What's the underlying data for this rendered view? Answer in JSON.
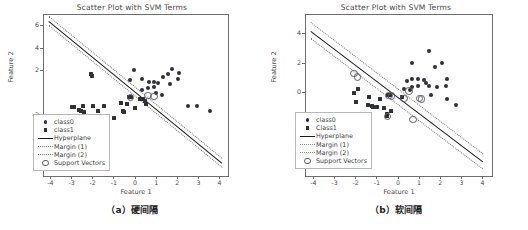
{
  "figure": {
    "captions": [
      "（a）硬间隔",
      "（b）软间隔"
    ]
  },
  "chart_data": [
    {
      "type": "scatter",
      "title": "Scatter Plot with SVM Terms",
      "xlabel": "Feature 1",
      "ylabel": "Feature 2",
      "xlim": [
        -4.35,
        4.35
      ],
      "ylim": [
        -7.4,
        7.0
      ],
      "xticks": [
        "-4",
        "-3",
        "-2",
        "-1",
        "0",
        "1",
        "2",
        "3",
        "4"
      ],
      "xtick_values": [
        -4,
        -3,
        -2,
        -1,
        0,
        1,
        2,
        3,
        4
      ],
      "yticks": [
        "-6",
        "-4",
        "-2",
        "2",
        "4",
        "6"
      ],
      "ytick_values": [
        -6,
        -4,
        -2,
        2,
        4,
        6
      ],
      "grid": false,
      "legend_position": "lower left",
      "legend": [
        {
          "label": "class0",
          "marker": "circle"
        },
        {
          "label": "class1",
          "marker": "square"
        },
        {
          "label": "Hyperplane",
          "marker": "solid-line"
        },
        {
          "label": "Margin (1)",
          "marker": "dotted-line"
        },
        {
          "label": "Margin (2)",
          "marker": "dotted-line"
        },
        {
          "label": "Support Vectors",
          "marker": "open-circle"
        }
      ],
      "series": [
        {
          "name": "class0",
          "marker": "circle",
          "points": [
            [
              -0.1,
              2.1
            ],
            [
              -0.28,
              1.15
            ],
            [
              0.28,
              1.3
            ],
            [
              0.62,
              1.05
            ],
            [
              0.86,
              1.05
            ],
            [
              1.02,
              0.95
            ],
            [
              1.3,
              1.45
            ],
            [
              1.52,
              1.7
            ],
            [
              1.7,
              2.15
            ],
            [
              2.02,
              1.85
            ],
            [
              1.98,
              1.28
            ],
            [
              1.6,
              0.8
            ],
            [
              0.86,
              0.55
            ],
            [
              0.55,
              0.45
            ],
            [
              0.3,
              0.3
            ],
            [
              2.48,
              -1.15
            ],
            [
              2.88,
              -1.15
            ],
            [
              3.48,
              -1.55
            ],
            [
              1.22,
              -0.15
            ],
            [
              0.95,
              0.05
            ]
          ]
        },
        {
          "name": "class1",
          "marker": "square",
          "points": [
            [
              -2.12,
              1.75
            ],
            [
              -2.1,
              1.55
            ],
            [
              -3.02,
              -1.2
            ],
            [
              -2.92,
              -1.22
            ],
            [
              -2.52,
              -1.18
            ],
            [
              -2.7,
              -1.5
            ],
            [
              -2.58,
              -1.62
            ],
            [
              -2.48,
              -1.72
            ],
            [
              -2.05,
              -1.12
            ],
            [
              -1.82,
              -1.62
            ],
            [
              -1.52,
              -1.12
            ],
            [
              -1.02,
              -2.2
            ],
            [
              -0.72,
              -0.85
            ],
            [
              -0.62,
              -1.55
            ],
            [
              -0.58,
              -1.7
            ],
            [
              -0.42,
              -0.92
            ],
            [
              -0.32,
              -0.3
            ],
            [
              -0.22,
              -0.32
            ],
            [
              -0.05,
              -1.35
            ],
            [
              0.18,
              -0.55
            ],
            [
              0.32,
              -0.48
            ],
            [
              0.42,
              -0.72
            ],
            [
              0.48,
              -0.98
            ]
          ]
        }
      ],
      "support_vectors": [
        [
          -0.3,
          -0.3
        ],
        [
          0.52,
          -0.12
        ],
        [
          0.8,
          -0.22
        ]
      ],
      "hyperplane": {
        "label": "Hyperplane",
        "p1": [
          -4.1,
          6.5
        ],
        "p2": [
          4.1,
          -6.2
        ]
      },
      "margins": [
        {
          "label": "Margin (1)",
          "p1": [
            -4.1,
            6.9
          ],
          "p2": [
            4.1,
            -5.8
          ]
        },
        {
          "label": "Margin (2)",
          "p1": [
            -4.1,
            6.1
          ],
          "p2": [
            4.1,
            -6.6
          ]
        }
      ]
    },
    {
      "type": "scatter",
      "title": "Scatter Plot with SVM Terms",
      "xlabel": "Feature 1",
      "ylabel": "Feature 2",
      "xlim": [
        -4.4,
        4.4
      ],
      "ylim": [
        -5.6,
        5.3
      ],
      "xticks": [
        "-4",
        "-3",
        "-2",
        "-1",
        "0",
        "1",
        "2",
        "3",
        "4"
      ],
      "xtick_values": [
        -4,
        -3,
        -2,
        -1,
        0,
        1,
        2,
        3,
        4
      ],
      "yticks": [
        "-4",
        "-2",
        "0",
        "2",
        "4"
      ],
      "ytick_values": [
        -4,
        -2,
        0,
        2,
        4
      ],
      "grid": false,
      "legend_position": "lower left",
      "legend": [
        {
          "label": "class0",
          "marker": "circle"
        },
        {
          "label": "Class1",
          "marker": "square"
        },
        {
          "label": "Hyperplane",
          "marker": "solid-line"
        },
        {
          "label": "Margin (1)",
          "marker": "dotted-line"
        },
        {
          "label": "Margin (2)",
          "marker": "dotted-line"
        },
        {
          "label": "Support Vectors",
          "marker": "open-circle"
        }
      ],
      "series": [
        {
          "name": "class0",
          "marker": "circle",
          "points": [
            [
              1.42,
              2.85
            ],
            [
              0.62,
              2.02
            ],
            [
              1.72,
              1.78
            ],
            [
              2.05,
              2.05
            ],
            [
              0.38,
              0.8
            ],
            [
              0.62,
              1.0
            ],
            [
              0.88,
              1.0
            ],
            [
              1.18,
              0.92
            ],
            [
              2.28,
              1.0
            ],
            [
              0.62,
              0.42
            ],
            [
              0.92,
              0.52
            ],
            [
              1.28,
              0.72
            ],
            [
              1.42,
              0.48
            ],
            [
              1.78,
              0.42
            ],
            [
              2.22,
              0.48
            ],
            [
              1.5,
              -0.12
            ],
            [
              2.28,
              -0.38
            ],
            [
              2.72,
              -0.82
            ],
            [
              0.22,
              0.28
            ],
            [
              0.52,
              0.22
            ]
          ]
        },
        {
          "name": "Class1",
          "marker": "square",
          "points": [
            [
              -1.92,
              0.32
            ],
            [
              -2.12,
              0.0
            ],
            [
              -2.05,
              -0.62
            ],
            [
              -1.42,
              -0.28
            ],
            [
              -1.45,
              -0.82
            ],
            [
              -1.3,
              -0.88
            ],
            [
              -1.22,
              -0.92
            ],
            [
              -1.05,
              -0.9
            ],
            [
              -0.88,
              -0.38
            ],
            [
              -1.38,
              -1.68
            ],
            [
              -1.42,
              -2.18
            ],
            [
              -0.72,
              -0.98
            ],
            [
              -0.55,
              -1.42
            ],
            [
              -0.38,
              -1.18
            ],
            [
              -0.52,
              -0.12
            ],
            [
              -0.42,
              -0.1
            ],
            [
              -0.58,
              -1.52
            ],
            [
              0.12,
              -0.28
            ]
          ]
        }
      ],
      "support_vectors": [
        [
          -2.18,
          1.42
        ],
        [
          -2.02,
          1.18
        ],
        [
          -0.52,
          -0.1
        ],
        [
          -0.4,
          -0.12
        ],
        [
          0.18,
          -0.3
        ],
        [
          0.42,
          0.22
        ],
        [
          0.92,
          -0.28
        ],
        [
          1.02,
          -0.32
        ],
        [
          -0.58,
          -1.52
        ],
        [
          0.62,
          -1.72
        ]
      ],
      "hyperplane": {
        "label": "Hyperplane",
        "p1": [
          -4.15,
          4.25
        ],
        "p2": [
          4.0,
          -4.6
        ]
      },
      "margins": [
        {
          "label": "Margin (1)",
          "p1": [
            -4.15,
            4.85
          ],
          "p2": [
            4.0,
            -4.05
          ]
        },
        {
          "label": "Margin (2)",
          "p1": [
            -4.15,
            3.75
          ],
          "p2": [
            4.0,
            -5.1
          ]
        }
      ]
    }
  ]
}
